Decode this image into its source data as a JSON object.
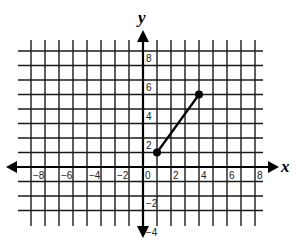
{
  "chart_data": {
    "type": "line",
    "title": "",
    "xlabel": "x",
    "ylabel": "y",
    "xlim": [
      -8,
      8
    ],
    "ylim": [
      -4,
      8
    ],
    "grid": true,
    "grid_step": 1,
    "x_tick_labels": [
      "-8",
      "-6",
      "-4",
      "-2",
      "0",
      "2",
      "4",
      "6",
      "8"
    ],
    "y_tick_labels": [
      "8",
      "6",
      "4",
      "2",
      "-2",
      "-4"
    ],
    "series": [
      {
        "name": "segment",
        "points": [
          [
            1,
            1
          ],
          [
            4,
            5
          ]
        ],
        "endpoints_marked": true
      }
    ]
  },
  "axes": {
    "x_label": "x",
    "y_label": "y"
  },
  "x_ticks": [
    {
      "value": -8,
      "label": "−8"
    },
    {
      "value": -6,
      "label": "−6"
    },
    {
      "value": -4,
      "label": "−4"
    },
    {
      "value": -2,
      "label": "−2"
    },
    {
      "value": 0,
      "label": "0"
    },
    {
      "value": 2,
      "label": "2"
    },
    {
      "value": 4,
      "label": "4"
    },
    {
      "value": 6,
      "label": "6"
    },
    {
      "value": 8,
      "label": "8"
    }
  ],
  "y_ticks": [
    {
      "value": 8,
      "label": "8"
    },
    {
      "value": 6,
      "label": "6"
    },
    {
      "value": 4,
      "label": "4"
    },
    {
      "value": 2,
      "label": "2"
    },
    {
      "value": -2,
      "label": "−2"
    },
    {
      "value": -4,
      "label": "−4"
    }
  ],
  "segment": {
    "start": [
      1,
      1
    ],
    "end": [
      4,
      5
    ]
  },
  "colors": {
    "ink": "#000000",
    "background": "#ffffff"
  }
}
